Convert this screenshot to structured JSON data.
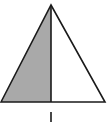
{
  "diagram": {
    "type": "geometry-figure",
    "shape": "isosceles-triangle",
    "apex": [
      51,
      5
    ],
    "base_left": [
      1,
      102
    ],
    "base_right": [
      105,
      102
    ],
    "altitude_foot": [
      51,
      102
    ],
    "shaded_region": "left-half",
    "fill_color": "#a9a9a9",
    "stroke_color": "#1a1a1a",
    "background": "#ffffff",
    "label_below": "|"
  }
}
